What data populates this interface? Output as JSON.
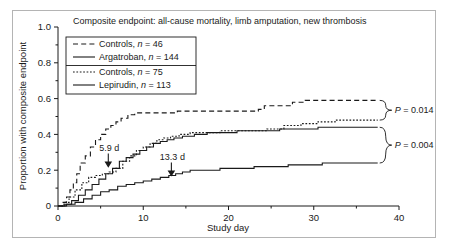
{
  "figure": {
    "border_color": "#b4b4b4",
    "background": "#ffffff"
  },
  "chart_data": {
    "type": "line",
    "title": "Composite endpoint: all-cause mortality, limb amputation, new thrombosis",
    "subtitle": "",
    "xlabel": "Study day",
    "ylabel": "Proportion with composite endpoint",
    "xlim": [
      0,
      40
    ],
    "ylim": [
      0,
      1.0
    ],
    "grid": false,
    "legend_position": "upper-left",
    "x_ticks_major": [
      0,
      10,
      20,
      30,
      40
    ],
    "x_tick_labels": [
      "0",
      "10",
      "20",
      "30",
      "40"
    ],
    "x_ticks_minor": [
      5,
      15,
      25,
      35
    ],
    "y_ticks_major": [
      0,
      0.2,
      0.4,
      0.6,
      0.8,
      1.0
    ],
    "y_tick_labels": [
      "0",
      "0.2",
      "0.4",
      "0.6",
      "0.8",
      "1.0"
    ],
    "y_ticks_minor": [
      0.1,
      0.3,
      0.5,
      0.7,
      0.9
    ],
    "series": [
      {
        "name": "Controls, n = 46",
        "style": "dashed-long",
        "points": [
          [
            0,
            0.0
          ],
          [
            0.6,
            0.02
          ],
          [
            1.0,
            0.05
          ],
          [
            1.4,
            0.09
          ],
          [
            1.8,
            0.13
          ],
          [
            2.2,
            0.18
          ],
          [
            2.6,
            0.24
          ],
          [
            3.2,
            0.28
          ],
          [
            3.8,
            0.33
          ],
          [
            4.4,
            0.37
          ],
          [
            5.0,
            0.4
          ],
          [
            5.6,
            0.43
          ],
          [
            6.2,
            0.45
          ],
          [
            6.8,
            0.47
          ],
          [
            7.4,
            0.49
          ],
          [
            8.2,
            0.51
          ],
          [
            9.0,
            0.52
          ],
          [
            12.0,
            0.52
          ],
          [
            14.0,
            0.53
          ],
          [
            17.0,
            0.53
          ],
          [
            20.0,
            0.53
          ],
          [
            23.5,
            0.54
          ],
          [
            24.2,
            0.56
          ],
          [
            26.0,
            0.56
          ],
          [
            27.5,
            0.58
          ],
          [
            29.0,
            0.59
          ],
          [
            33.0,
            0.59
          ],
          [
            37.5,
            0.59
          ]
        ]
      },
      {
        "name": "Argatroban, n = 144",
        "style": "solid",
        "points": [
          [
            0,
            0.0
          ],
          [
            0.8,
            0.01
          ],
          [
            1.6,
            0.03
          ],
          [
            2.4,
            0.06
          ],
          [
            3.2,
            0.09
          ],
          [
            4.0,
            0.12
          ],
          [
            4.8,
            0.15
          ],
          [
            5.6,
            0.18
          ],
          [
            6.4,
            0.21
          ],
          [
            7.2,
            0.25
          ],
          [
            8.0,
            0.27
          ],
          [
            8.8,
            0.29
          ],
          [
            9.6,
            0.31
          ],
          [
            10.4,
            0.33
          ],
          [
            11.2,
            0.35
          ],
          [
            12.0,
            0.36
          ],
          [
            12.8,
            0.37
          ],
          [
            13.6,
            0.38
          ],
          [
            14.6,
            0.39
          ],
          [
            16.0,
            0.4
          ],
          [
            17.5,
            0.41
          ],
          [
            19.0,
            0.41
          ],
          [
            21.0,
            0.42
          ],
          [
            23.0,
            0.42
          ],
          [
            25.0,
            0.42
          ],
          [
            26.0,
            0.43
          ],
          [
            28.5,
            0.43
          ],
          [
            30.5,
            0.44
          ],
          [
            33.0,
            0.44
          ],
          [
            37.5,
            0.44
          ]
        ]
      },
      {
        "name": "Controls, n = 75",
        "style": "dotted-short",
        "points": [
          [
            0,
            0.0
          ],
          [
            0.7,
            0.02
          ],
          [
            1.3,
            0.05
          ],
          [
            2.0,
            0.09
          ],
          [
            2.8,
            0.13
          ],
          [
            3.6,
            0.16
          ],
          [
            4.4,
            0.17
          ],
          [
            5.2,
            0.18
          ],
          [
            6.0,
            0.19
          ],
          [
            6.8,
            0.21
          ],
          [
            7.6,
            0.25
          ],
          [
            8.4,
            0.28
          ],
          [
            9.2,
            0.31
          ],
          [
            10.0,
            0.33
          ],
          [
            10.8,
            0.35
          ],
          [
            11.6,
            0.37
          ],
          [
            12.4,
            0.38
          ],
          [
            13.2,
            0.39
          ],
          [
            14.2,
            0.4
          ],
          [
            15.5,
            0.41
          ],
          [
            17.0,
            0.41
          ],
          [
            19.0,
            0.42
          ],
          [
            21.0,
            0.42
          ],
          [
            23.0,
            0.42
          ],
          [
            24.5,
            0.43
          ],
          [
            26.5,
            0.45
          ],
          [
            28.5,
            0.46
          ],
          [
            30.5,
            0.47
          ],
          [
            32.5,
            0.48
          ],
          [
            34.5,
            0.48
          ],
          [
            37.5,
            0.48
          ]
        ]
      },
      {
        "name": "Lepirudin, n = 113",
        "style": "solid",
        "points": [
          [
            0,
            0.0
          ],
          [
            1.0,
            0.01
          ],
          [
            2.0,
            0.02
          ],
          [
            3.0,
            0.04
          ],
          [
            4.0,
            0.06
          ],
          [
            5.0,
            0.08
          ],
          [
            6.0,
            0.09
          ],
          [
            7.0,
            0.11
          ],
          [
            8.0,
            0.12
          ],
          [
            9.0,
            0.13
          ],
          [
            10.0,
            0.14
          ],
          [
            11.0,
            0.15
          ],
          [
            12.0,
            0.16
          ],
          [
            13.0,
            0.17
          ],
          [
            13.8,
            0.18
          ],
          [
            14.6,
            0.19
          ],
          [
            15.5,
            0.2
          ],
          [
            17.0,
            0.2
          ],
          [
            19.0,
            0.21
          ],
          [
            21.0,
            0.21
          ],
          [
            23.0,
            0.22
          ],
          [
            25.0,
            0.22
          ],
          [
            27.0,
            0.23
          ],
          [
            29.0,
            0.23
          ],
          [
            31.0,
            0.24
          ],
          [
            34.0,
            0.24
          ],
          [
            37.5,
            0.24
          ]
        ]
      }
    ],
    "annotations": [
      {
        "id": "median-argatroban",
        "label": "5.9 d",
        "x": 5.9,
        "y": 0.22,
        "marker": "down-arrow"
      },
      {
        "id": "median-lepirudin",
        "label": "13.3 d",
        "x": 13.3,
        "y": 0.17,
        "marker": "down-arrow"
      },
      {
        "id": "p-value-upper",
        "label": "P = 0.014",
        "label_italic": "P",
        "label_rest": " = 0.014"
      },
      {
        "id": "p-value-lower",
        "label": "P = 0.004",
        "label_italic": "P",
        "label_rest": " = 0.004"
      }
    ]
  },
  "legend": {
    "entries": [
      {
        "label_prefix": "Controls, ",
        "label_italic": "n",
        "label_suffix": " = 46",
        "style": "dashed-long"
      },
      {
        "label_prefix": "Argatroban, ",
        "label_italic": "n",
        "label_suffix": " = 144",
        "style": "solid"
      },
      {
        "label_prefix": "Controls, ",
        "label_italic": "n",
        "label_suffix": " = 75",
        "style": "dotted-short"
      },
      {
        "label_prefix": "Lepirudin, ",
        "label_italic": "n",
        "label_suffix": " = 113",
        "style": "solid"
      }
    ]
  }
}
